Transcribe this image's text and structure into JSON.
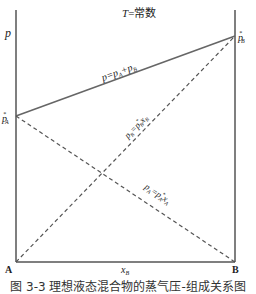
{
  "diagram": {
    "title": "T=常数",
    "y_axis_label": "p",
    "x_axis_label": "xB",
    "left_corner_label": "A",
    "right_corner_label": "B",
    "left_intercept_label": "p*A",
    "right_intercept_label": "p*B",
    "lines": [
      {
        "name": "total-pressure",
        "label": "p=pA+pB",
        "style": "solid",
        "from": "p*A at A",
        "to": "p*B at B"
      },
      {
        "name": "partial-pressure-B",
        "label": "pB=p*B xB",
        "style": "dashed",
        "from": "0 at A",
        "to": "p*B at B"
      },
      {
        "name": "partial-pressure-A",
        "label": "pA=p*A xA",
        "style": "dashed",
        "from": "p*A at A",
        "to": "0 at B"
      }
    ],
    "colors": {
      "axis": "#555555",
      "line": "#666666",
      "text": "#222222"
    },
    "caption": "图 3-3 理想液态混合物的蒸气压-组成关系图"
  }
}
